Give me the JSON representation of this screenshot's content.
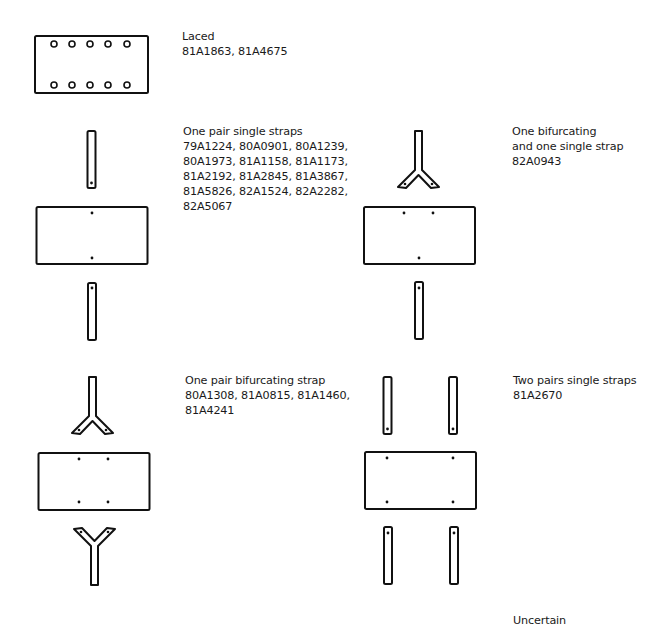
{
  "variants": [
    {
      "id": "laced",
      "title": "Laced",
      "lines": [
        "81A1863, 81A4675"
      ],
      "caption_pos": {
        "x": 182,
        "y": 29
      }
    },
    {
      "id": "one-pair-single",
      "title": "One pair single straps",
      "lines": [
        "79A1224, 80A0901, 80A1239,",
        "80A1973, 81A1158, 81A1173,",
        "81A2192, 81A2845, 81A3867,",
        "81A5826, 82A1524, 82A2282,",
        "82A5067"
      ],
      "caption_pos": {
        "x": 183,
        "y": 124
      }
    },
    {
      "id": "one-bifurcating-one-single",
      "title": "One bifurcating",
      "lines": [
        "and one single strap",
        "82A0943"
      ],
      "caption_pos": {
        "x": 512,
        "y": 124
      }
    },
    {
      "id": "one-pair-bifurcating",
      "title": "One pair bifurcating strap",
      "lines": [
        "80A1308, 81A0815, 81A1460,",
        "81A4241"
      ],
      "caption_pos": {
        "x": 185,
        "y": 373
      }
    },
    {
      "id": "two-pairs-single",
      "title": "Two pairs single straps",
      "lines": [
        "81A2670"
      ],
      "caption_pos": {
        "x": 513,
        "y": 373
      }
    },
    {
      "id": "uncertain",
      "title": "Uncertain",
      "lines": [],
      "caption_pos": {
        "x": 513,
        "y": 613
      }
    }
  ],
  "colors": {
    "stroke": "#111111",
    "background": "#ffffff",
    "text": "#1a1a1a"
  }
}
